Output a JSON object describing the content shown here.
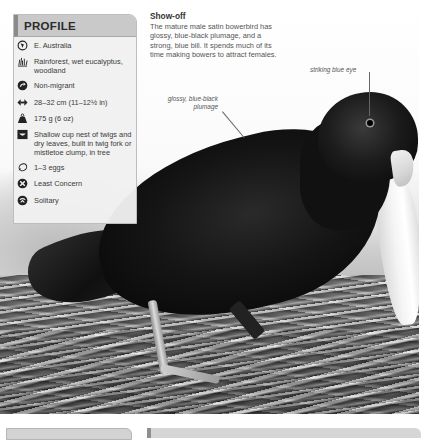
{
  "profile": {
    "title": "PROFILE",
    "items": [
      {
        "icon": "globe-icon",
        "text": "E. Australia"
      },
      {
        "icon": "habitat-grass-icon",
        "text": "Rainforest, wet eucalyptus, woodland"
      },
      {
        "icon": "migration-arrow-icon",
        "text": "Non-migrant"
      },
      {
        "icon": "wingspan-arrows-icon",
        "text": "28–32 cm (11–12½ in)"
      },
      {
        "icon": "weight-icon",
        "text": "175 g (6 oz)"
      },
      {
        "icon": "nest-icon",
        "text": "Shallow cup nest of twigs and dry leaves, built in twig fork or mistletoe clump, in tree"
      },
      {
        "icon": "egg-icon",
        "text": "1–3 eggs"
      },
      {
        "icon": "conservation-status-icon",
        "text": "Least Concern"
      },
      {
        "icon": "social-behavior-icon",
        "text": "Solitary"
      }
    ]
  },
  "description": {
    "title": "Show-off",
    "body": "The mature male satin bowerbird has glossy, blue-black plumage, and a strong, blue bill. It spends much of its time making bowers to attract females."
  },
  "annotations": {
    "eye": "striking blue eye",
    "plumage": "glossy, blue-black plumage"
  },
  "photo": {
    "subject": "satin bowerbird on nest twigs"
  }
}
